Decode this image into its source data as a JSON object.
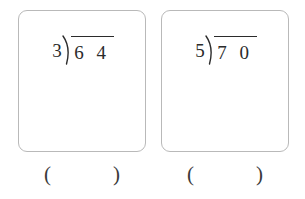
{
  "worksheet": {
    "background_color": "#ffffff",
    "ink_color": "#2b2b2b",
    "box_border_color": "#b9b9b9",
    "problems": [
      {
        "id": "problem-1",
        "divisor": "3",
        "dividend": "6 4",
        "expression": "3)64",
        "answer_open_paren": "(",
        "answer_value": "",
        "answer_close_paren": ")"
      },
      {
        "id": "problem-2",
        "divisor": "5",
        "dividend": "7 0",
        "expression": "5)70",
        "answer_open_paren": "(",
        "answer_value": "",
        "answer_close_paren": ")"
      }
    ]
  }
}
